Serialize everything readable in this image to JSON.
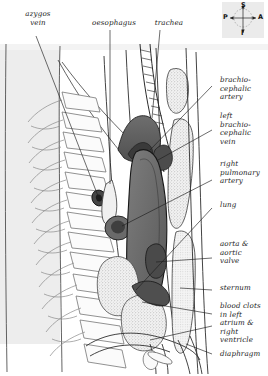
{
  "figure": {
    "type": "anatomical-illustration",
    "view": "sagittal-section-thorax",
    "background_color": "#ffffff",
    "ink_color": "#1b1b1b"
  },
  "compass": {
    "name": "orientation-compass",
    "background_color": "#ebebeb",
    "posterior": "P",
    "anterior": "A",
    "superior": "S",
    "inferior": "I"
  },
  "labels": {
    "top": [
      {
        "id": "azygos-vein",
        "text": "azygos\nvein"
      },
      {
        "id": "oesophagus",
        "text": "oesophagus"
      },
      {
        "id": "trachea",
        "text": "trachea"
      }
    ],
    "right": [
      {
        "id": "brachiocephalic-artery",
        "text": "brachio-\ncephalic\nartery"
      },
      {
        "id": "left-brachiocephalic-vein",
        "text": "left\nbrachio-\ncephalic\nvein"
      },
      {
        "id": "right-pulmonary-artery",
        "text": "right\npulmonary\nartery"
      },
      {
        "id": "lung",
        "text": "lung"
      },
      {
        "id": "aorta-and-aortic-valve",
        "text": "aorta &\naortic\nvalve"
      },
      {
        "id": "sternum",
        "text": "sternum"
      },
      {
        "id": "blood-clots",
        "text": "blood clots\nin left\natrium &\nright\nventricle"
      },
      {
        "id": "diaphragm",
        "text": "diaphragm"
      }
    ]
  }
}
